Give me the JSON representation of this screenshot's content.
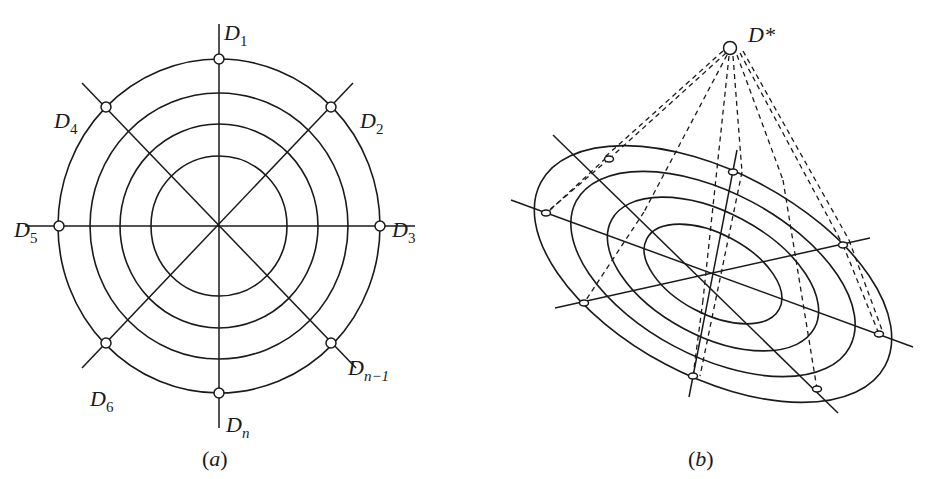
{
  "figure": {
    "panel_a": {
      "caption": "(a)",
      "caption_letter": "a",
      "center": [
        219,
        226
      ],
      "rings_radii": [
        68,
        99,
        129,
        161
      ],
      "outer_ry": 167,
      "axes_angles_deg": [
        90,
        45,
        0,
        -45
      ],
      "nodes": [
        {
          "id": "D1",
          "base": "D",
          "sub": "1",
          "pos": [
            219,
            59
          ],
          "label_pos": [
            224,
            22
          ]
        },
        {
          "id": "D2",
          "base": "D",
          "sub": "2",
          "pos": [
            331,
            107
          ],
          "label_pos": [
            360,
            110
          ]
        },
        {
          "id": "D3",
          "base": "D",
          "sub": "3",
          "pos": [
            380,
            226
          ],
          "label_pos": [
            392,
            219
          ]
        },
        {
          "id": "D4",
          "base": "D",
          "sub": "4",
          "pos": [
            106,
            107
          ],
          "label_pos": [
            54,
            110
          ]
        },
        {
          "id": "D5",
          "base": "D",
          "sub": "5",
          "pos": [
            59,
            226
          ],
          "label_pos": [
            14,
            219
          ]
        },
        {
          "id": "D6",
          "base": "D",
          "sub": "6",
          "pos": [
            106,
            343
          ],
          "label_pos": [
            90,
            388
          ]
        },
        {
          "id": "Dn-1",
          "base": "D",
          "sub": "n−1",
          "pos": [
            331,
            343
          ],
          "label_pos": [
            348,
            357
          ]
        },
        {
          "id": "Dn",
          "base": "D",
          "sub": "n",
          "pos": [
            219,
            393
          ],
          "label_pos": [
            226,
            414
          ]
        }
      ]
    },
    "panel_b": {
      "caption": "(b)",
      "caption_letter": "b",
      "apex_label": "D*",
      "apex": [
        730,
        48
      ],
      "center": [
        713,
        274
      ],
      "rotation_deg": 28,
      "rings": [
        [
          75,
          40
        ],
        [
          115,
          62
        ],
        [
          155,
          82
        ],
        [
          195,
          102
        ]
      ],
      "axes": [
        [
          [
            511,
            200
          ],
          [
            913,
            347
          ]
        ],
        [
          [
            553,
            135
          ],
          [
            838,
            413
          ]
        ],
        [
          [
            737,
            150
          ],
          [
            689,
            397
          ]
        ],
        [
          [
            555,
            308
          ],
          [
            870,
            238
          ]
        ]
      ],
      "nodes": [
        [
          609,
          159
        ],
        [
          733,
          172
        ],
        [
          546,
          213
        ],
        [
          843,
          245
        ],
        [
          584,
          303
        ],
        [
          879,
          334
        ],
        [
          693,
          376
        ],
        [
          817,
          389
        ]
      ],
      "dashed_lines": [
        [
          [
            726,
            53
          ],
          [
            609,
            159
          ]
        ],
        [
          [
            723,
            51
          ],
          [
            605,
            157
          ]
        ],
        [
          [
            609,
            159
          ],
          [
            546,
            213
          ]
        ],
        [
          [
            606,
            158
          ],
          [
            549,
            211
          ]
        ],
        [
          [
            727,
            55
          ],
          [
            644,
            212
          ]
        ],
        [
          [
            644,
            212
          ],
          [
            584,
            303
          ]
        ],
        [
          [
            729,
            56
          ],
          [
            703,
            300
          ]
        ],
        [
          [
            703,
            300
          ],
          [
            693,
            376
          ]
        ],
        [
          [
            733,
            56
          ],
          [
            742,
            172
          ]
        ],
        [
          [
            742,
            172
          ],
          [
            700,
            376
          ]
        ],
        [
          [
            737,
            55
          ],
          [
            783,
            180
          ]
        ],
        [
          [
            783,
            180
          ],
          [
            817,
            389
          ]
        ],
        [
          [
            740,
            53
          ],
          [
            843,
            245
          ]
        ],
        [
          [
            743,
            51
          ],
          [
            849,
            240
          ]
        ],
        [
          [
            843,
            245
          ],
          [
            879,
            334
          ]
        ],
        [
          [
            849,
            240
          ],
          [
            882,
            330
          ]
        ]
      ]
    }
  }
}
